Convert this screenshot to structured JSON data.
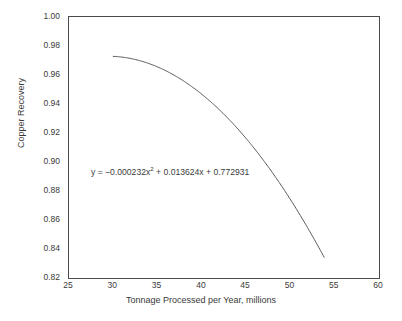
{
  "chart_data": {
    "type": "line",
    "title": "",
    "subtitle": "",
    "xlabel": "Tonnage Processed per Year, millions",
    "ylabel": "Copper Recovery",
    "xlim": [
      25,
      60
    ],
    "ylim": [
      0.82,
      1.0
    ],
    "xticks": [
      25,
      30,
      35,
      40,
      45,
      50,
      55,
      60
    ],
    "xtick_labels": [
      "25",
      "30",
      "35",
      "40",
      "45",
      "50",
      "55",
      "60"
    ],
    "yticks": [
      0.82,
      0.84,
      0.86,
      0.88,
      0.9,
      0.92,
      0.94,
      0.96,
      0.98,
      1.0
    ],
    "ytick_labels": [
      "0.82",
      "0.84",
      "0.86",
      "0.88",
      "0.90",
      "0.92",
      "0.94",
      "0.96",
      "0.98",
      "1.00"
    ],
    "grid": false,
    "legend": null,
    "legend_position": "none",
    "annotations": [
      {
        "name": "regression-equation",
        "text_prefix": "y = −0.000232x",
        "text_exponent": "2",
        "text_suffix": " + 0.013624x + 0.772931",
        "full_text": "y = −0.000232x² + 0.013624x + 0.772931",
        "x": 31.5,
        "y": 0.893
      }
    ],
    "series": [
      {
        "name": "Copper recovery quadratic fit",
        "color": "#555555",
        "line_width": 1,
        "equation": {
          "a": -0.000232,
          "b": 0.013624,
          "c": 0.772931
        },
        "x_domain": [
          30,
          53.8
        ],
        "x": [
          30,
          31,
          32,
          33,
          34,
          35,
          36,
          37,
          38,
          39,
          40,
          41,
          42,
          43,
          44,
          45,
          46,
          47,
          48,
          49,
          50,
          51,
          52,
          53,
          53.8
        ],
        "values": [
          0.97285,
          0.97377,
          0.97422,
          0.97421,
          0.97374,
          0.97281,
          0.97141,
          0.96955,
          0.96723,
          0.96444,
          0.96119,
          0.95748,
          0.95331,
          0.94867,
          0.94357,
          0.93801,
          0.93199,
          0.9255,
          0.91855,
          0.91114,
          0.90327,
          0.89493,
          0.88613,
          0.87687,
          0.8691
        ]
      }
    ]
  },
  "axes": {
    "y_title": "Copper Recovery",
    "x_title": "Tonnage Processed per Year, millions"
  }
}
